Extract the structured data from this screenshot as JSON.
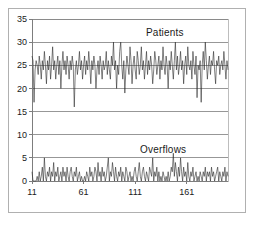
{
  "figure": {
    "background_color": "#ffffff",
    "frame_color": "#b0b0b0",
    "grid_color": "#7d7d7d",
    "line_color": "#2b2b2b"
  },
  "labels": {
    "patients": "Patients",
    "overflows": "Overflows"
  },
  "chart_data": {
    "type": "line",
    "title": "",
    "xlabel": "",
    "ylabel": "",
    "xlim": [
      11,
      201
    ],
    "ylim": [
      0,
      35
    ],
    "grid": true,
    "legend_position": "inline-annotation",
    "yticks": [
      0,
      5,
      10,
      15,
      20,
      25,
      30,
      35
    ],
    "ytick_labels": [
      "0",
      "5",
      "10",
      "15",
      "20",
      "25",
      "30",
      "35"
    ],
    "xticks": [
      11,
      61,
      111,
      161
    ],
    "xtick_labels": [
      "11",
      "61",
      "111",
      "161"
    ],
    "annotations": [
      {
        "text": "Patients",
        "x": 130,
        "y": 32
      },
      {
        "text": "Overflows",
        "x": 124,
        "y": 7
      }
    ],
    "series": [
      {
        "name": "Patients",
        "x_start": 11,
        "x_step": 1,
        "values": [
          27,
          26,
          17,
          24,
          26,
          25,
          23,
          27,
          25,
          22,
          26,
          24,
          28,
          25,
          21,
          26,
          24,
          27,
          22,
          25,
          29,
          24,
          26,
          22,
          25,
          27,
          23,
          26,
          20,
          25,
          28,
          24,
          26,
          23,
          27,
          25,
          22,
          26,
          24,
          27,
          25,
          16,
          24,
          26,
          23,
          25,
          28,
          24,
          26,
          22,
          25,
          27,
          23,
          26,
          24,
          28,
          25,
          21,
          26,
          24,
          27,
          25,
          20,
          24,
          26,
          23,
          27,
          25,
          22,
          26,
          24,
          25,
          28,
          23,
          26,
          24,
          22,
          27,
          25,
          30,
          24,
          26,
          20,
          25,
          23,
          28,
          30,
          25,
          22,
          26,
          19,
          24,
          27,
          25,
          23,
          29,
          26,
          21,
          25,
          27,
          24,
          22,
          28,
          26,
          23,
          25,
          29,
          24,
          26,
          22,
          25,
          28,
          23,
          26,
          24,
          27,
          25,
          21,
          24,
          28,
          26,
          23,
          25,
          27,
          22,
          26,
          24,
          29,
          25,
          23,
          27,
          25,
          20,
          26,
          24,
          28,
          25,
          22,
          26,
          30,
          24,
          27,
          23,
          25,
          28,
          24,
          26,
          21,
          25,
          27,
          23,
          29,
          25,
          24,
          26,
          22,
          28,
          25,
          23,
          27,
          18,
          25,
          24,
          26,
          17,
          25,
          28,
          24,
          30,
          26,
          22,
          25,
          27,
          23,
          26,
          25,
          28,
          24,
          21,
          26,
          25,
          27,
          23,
          25,
          26,
          24,
          28,
          25,
          22,
          26,
          24,
          27,
          25,
          23,
          26,
          22,
          25,
          27,
          24,
          26,
          23,
          25,
          22
        ]
      },
      {
        "name": "Overflows",
        "x_start": 11,
        "x_step": 1,
        "values": [
          2,
          0,
          0,
          0,
          0,
          1,
          0,
          2,
          0,
          1,
          3,
          0,
          5,
          1,
          0,
          2,
          1,
          3,
          0,
          2,
          1,
          4,
          0,
          2,
          1,
          3,
          0,
          1,
          2,
          0,
          3,
          1,
          2,
          0,
          3,
          1,
          0,
          2,
          3,
          1,
          0,
          2,
          1,
          3,
          0,
          1,
          2,
          0,
          1,
          0,
          0,
          1,
          0,
          2,
          1,
          0,
          3,
          1,
          2,
          0,
          1,
          3,
          2,
          0,
          4,
          1,
          2,
          0,
          3,
          1,
          2,
          0,
          1,
          3,
          5,
          0,
          2,
          1,
          4,
          2,
          0,
          3,
          1,
          0,
          2,
          1,
          3,
          0,
          2,
          1,
          0,
          3,
          2,
          0,
          1,
          2,
          0,
          1,
          0,
          2,
          3,
          1,
          0,
          2,
          4,
          1,
          0,
          2,
          3,
          1,
          0,
          2,
          1,
          0,
          3,
          2,
          1,
          5,
          0,
          2,
          1,
          3,
          0,
          2,
          0,
          1,
          0,
          2,
          1,
          0,
          1,
          0,
          2,
          0,
          1,
          3,
          2,
          6,
          1,
          4,
          2,
          0,
          3,
          1,
          5,
          2,
          0,
          3,
          1,
          2,
          0,
          4,
          1,
          0,
          2,
          1,
          3,
          0,
          1,
          2,
          0,
          1,
          0,
          2,
          1,
          0,
          2,
          1,
          3,
          0,
          2,
          1,
          2,
          0,
          3,
          1,
          2,
          0,
          1,
          2,
          3,
          0,
          2,
          1,
          0,
          2,
          1,
          3,
          0,
          2,
          1,
          0
        ]
      }
    ]
  }
}
